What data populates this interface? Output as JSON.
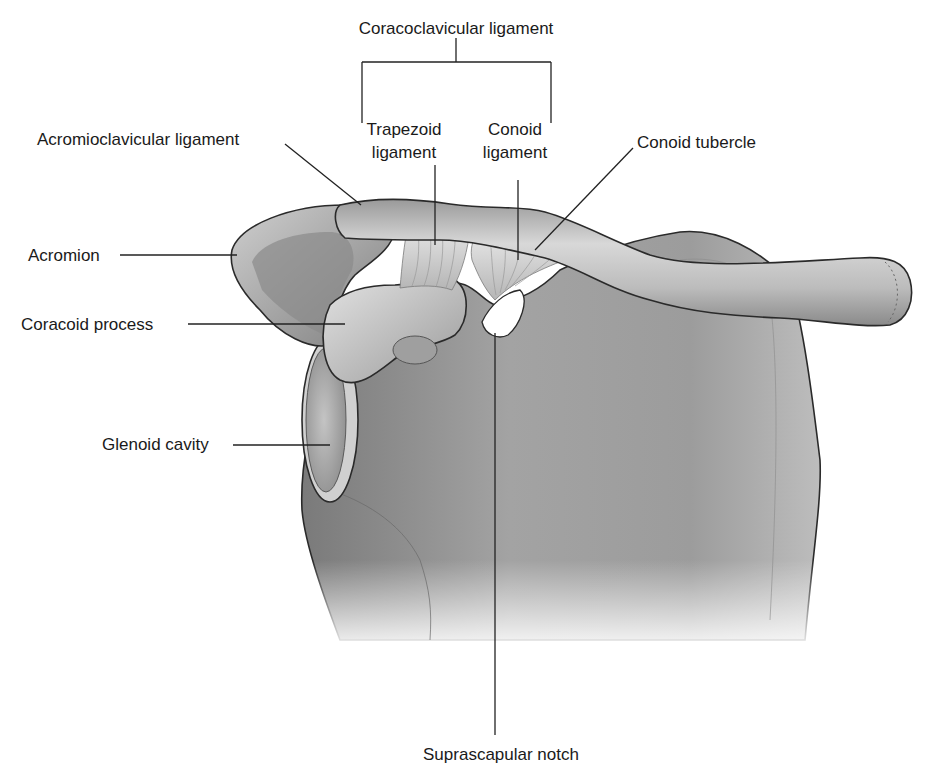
{
  "figure": {
    "labels": {
      "coracoclavicular_ligament": "Coracoclavicular ligament",
      "trapezoid_line1": "Trapezoid",
      "trapezoid_line2": "ligament",
      "conoid_line1": "Conoid",
      "conoid_line2": "ligament",
      "acromioclavicular_ligament": "Acromioclavicular ligament",
      "conoid_tubercle": "Conoid tubercle",
      "acromion": "Acromion",
      "coracoid_process": "Coracoid process",
      "glenoid_cavity": "Glenoid cavity",
      "suprascapular_notch": "Suprascapular notch"
    },
    "colors": {
      "background": "#ffffff",
      "bone_light": "#d9d9d9",
      "bone_mid": "#a8a8a8",
      "bone_dark": "#6e6e6e",
      "outline": "#2a2a2a",
      "text": "#1a1a1a"
    }
  }
}
